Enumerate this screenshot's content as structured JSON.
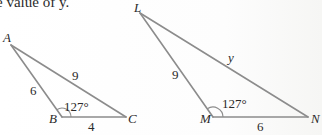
{
  "caption": "e value of y.",
  "triangles": [
    {
      "name": "ABC",
      "vertices": [
        {
          "label": "A",
          "x": 11,
          "y": 45
        },
        {
          "label": "B",
          "x": 62,
          "y": 117
        },
        {
          "label": "C",
          "x": 126,
          "y": 117
        }
      ],
      "side_labels": {
        "AB": "6",
        "AC": "9",
        "BC": "4"
      },
      "angle_label": "127°",
      "angle_vertex": "B"
    },
    {
      "name": "LMN",
      "vertices": [
        {
          "label": "L",
          "x": 140,
          "y": 13
        },
        {
          "label": "M",
          "x": 213,
          "y": 117
        },
        {
          "label": "N",
          "x": 308,
          "y": 117
        }
      ],
      "side_labels": {
        "LM": "9",
        "LN": "y",
        "MN": "6"
      },
      "angle_label": "127°",
      "angle_vertex": "M"
    }
  ],
  "colors": {
    "line": "#8c8c8c",
    "text": "#2a2a2a"
  }
}
